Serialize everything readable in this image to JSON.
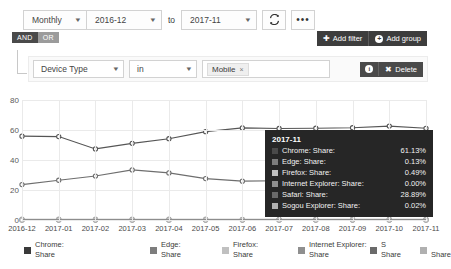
{
  "toolbar": {
    "period": "Monthly",
    "date_from": "2016-12",
    "to_label": "to",
    "date_to": "2017-11",
    "refresh_icon": "refresh-icon",
    "more_icon": "ellipsis-icon"
  },
  "builder": {
    "and_label": "AND",
    "or_label": "OR",
    "add_filter_label": "Add filter",
    "add_group_label": "Add group",
    "filter": {
      "field": "Device Type",
      "operator": "in",
      "value_chip": "Mobile",
      "chip_remove": "×",
      "info_icon": "info-icon",
      "delete_label": "Delete"
    }
  },
  "chart_data": {
    "type": "line",
    "title": "",
    "xlabel": "",
    "ylabel": "",
    "ylim": [
      0,
      80
    ],
    "yticks": [
      0,
      20,
      40,
      60,
      80
    ],
    "grid": true,
    "legend_position": "bottom",
    "categories": [
      "2016-12",
      "2017-01",
      "2017-02",
      "2017-03",
      "2017-04",
      "2017-05",
      "2017-06",
      "2017-07",
      "2017-08",
      "2017-09",
      "2017-10",
      "2017-11"
    ],
    "series": [
      {
        "name": "Chrome: Share",
        "color": "#555555",
        "values": [
          55.9,
          55.6,
          47.4,
          51.1,
          54.2,
          58.9,
          61.4,
          61.0,
          61.2,
          61.5,
          62.6,
          61.13
        ]
      },
      {
        "name": "Edge: Share",
        "color": "#8a8a8a",
        "values": [
          0.1,
          0.1,
          0.11,
          0.11,
          0.12,
          0.12,
          0.12,
          0.13,
          0.13,
          0.13,
          0.13,
          0.13
        ]
      },
      {
        "name": "Firefox: Share",
        "color": "#a8a8a8",
        "values": [
          0.52,
          0.51,
          0.5,
          0.5,
          0.49,
          0.49,
          0.48,
          0.48,
          0.49,
          0.49,
          0.49,
          0.49
        ]
      },
      {
        "name": "Internet Explorer: Share",
        "color": "#9a9a9a",
        "values": [
          0.0,
          0.0,
          0.0,
          0.0,
          0.0,
          0.0,
          0.0,
          0.0,
          0.0,
          0.0,
          0.0,
          0.0
        ]
      },
      {
        "name": "Safari: Share",
        "color": "#6e6e6e",
        "values": [
          23.6,
          26.5,
          29.3,
          33.4,
          31.4,
          27.6,
          25.9,
          26.2,
          26.0,
          25.8,
          25.6,
          28.89
        ]
      },
      {
        "name": "Sogou Explorer: Share",
        "color": "#b4b4b4",
        "values": [
          0.02,
          0.02,
          0.02,
          0.02,
          0.02,
          0.02,
          0.02,
          0.02,
          0.02,
          0.02,
          0.02,
          0.02
        ]
      }
    ]
  },
  "legend": [
    {
      "label": "Chrome:\nShare",
      "color": "#3a3a3a"
    },
    {
      "label": "Edge:\nShare",
      "color": "#7d7d7d"
    },
    {
      "label": "Firefox:\nShare",
      "color": "#c0c0c0"
    },
    {
      "label": "Internet Explorer:\nShare",
      "color": "#8f8f8f"
    },
    {
      "label": "S\nShare",
      "color": "#6a6a6a"
    },
    {
      "label": "\nShare",
      "color": "#b0b0b0"
    }
  ],
  "tooltip": {
    "title": "2017-11",
    "rows": [
      {
        "name": "Chrome: Share:",
        "value": "61.13%",
        "color": "#4a4a4a"
      },
      {
        "name": "Edge: Share:",
        "value": "0.13%",
        "color": "#7d7d7d"
      },
      {
        "name": "Firefox: Share:",
        "value": "0.49%",
        "color": "#c0c0c0"
      },
      {
        "name": "Internet Explorer: Share:",
        "value": "0.00%",
        "color": "#8f8f8f"
      },
      {
        "name": "Safari: Share:",
        "value": "28.89%",
        "color": "#6a6a6a"
      },
      {
        "name": "Sogou Explorer: Share:",
        "value": "0.02%",
        "color": "#b0b0b0"
      }
    ]
  }
}
